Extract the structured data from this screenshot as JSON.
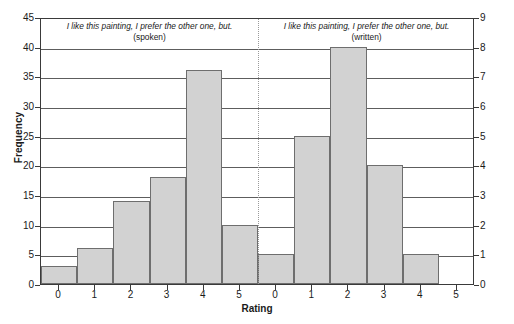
{
  "chart_data": {
    "type": "bar",
    "title": "",
    "xlabel": "Rating",
    "ylabel": "Frequency",
    "ylabel_right": "",
    "ylim": [
      0,
      45
    ],
    "ylim_right": [
      0,
      9
    ],
    "grid": true,
    "legend_position": "none",
    "categories": [
      "0",
      "1",
      "2",
      "3",
      "4",
      "5"
    ],
    "panels": [
      {
        "title": "I like this painting, I prefer the other one, but.",
        "subtitle": "(spoken)",
        "scale": "left",
        "categories": [
          "0",
          "1",
          "2",
          "3",
          "4",
          "5"
        ],
        "values": [
          3,
          6,
          14,
          18,
          36,
          10
        ]
      },
      {
        "title": "I like this painting, I prefer the other one, but.",
        "subtitle": "(written)",
        "scale": "right",
        "categories": [
          "0",
          "1",
          "2",
          "3",
          "4",
          "5"
        ],
        "values": [
          1,
          5,
          8,
          4,
          1,
          0
        ],
        "values_left_scale": [
          5,
          25,
          40,
          20,
          5,
          0
        ]
      }
    ],
    "yticks_left": [
      "0",
      "5",
      "10",
      "15",
      "20",
      "25",
      "30",
      "35",
      "40",
      "45"
    ],
    "yticks_right": [
      "0",
      "1",
      "2",
      "3",
      "4",
      "5",
      "6",
      "7",
      "8",
      "9"
    ],
    "colors": {
      "bar_fill": "#d2d2d2",
      "bar_edge": "#6e6e6e",
      "gridline": "#5d5d5d",
      "axis": "#3a3a3a",
      "divider": "#9a9a9a",
      "background": "#ffffff",
      "text": "#1a1a1a"
    }
  }
}
